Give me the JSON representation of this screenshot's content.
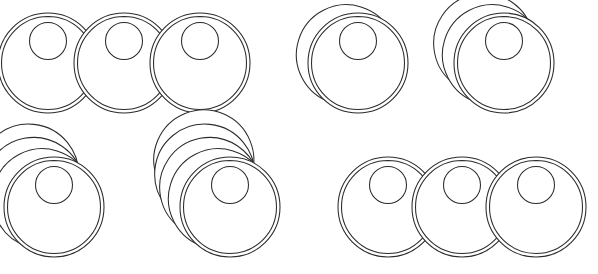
{
  "figure": {
    "canvas": {
      "width": 598,
      "height": 274
    },
    "background_color": "#ffffff",
    "stroke_color": "#2b2b2b",
    "fill_color": "#ffffff",
    "stroke_width": 1.05,
    "shape": {
      "name": "capsule-with-top-circle",
      "body_width": 52,
      "body_height": 100,
      "corner_radius": 26,
      "inner_contour_inset": 3.5,
      "circle_diameter": 37,
      "circle_center_offset_y": 28
    },
    "rotation": {
      "pivot_description": "top-right of capsule body",
      "pivot_x_fraction": 0.92,
      "pivot_y_fraction": 0.07,
      "step_degrees": 17,
      "direction": "clockwise"
    },
    "groups": [
      {
        "id": "group-a",
        "row": 1,
        "column": 1,
        "kind": "separate",
        "label": "three separate capsules",
        "count": 3,
        "copies": 1,
        "origin_x": 22,
        "origin_y": 13,
        "spacing_x": 76
      },
      {
        "id": "group-b",
        "row": 1,
        "column": 2,
        "kind": "fan",
        "label": "fan of two capsules",
        "count": 1,
        "copies": 2,
        "origin_x": 332,
        "origin_y": 13,
        "spacing_x": 0
      },
      {
        "id": "group-c",
        "row": 1,
        "column": 3,
        "kind": "fan",
        "label": "fan of three capsules",
        "count": 1,
        "copies": 3,
        "origin_x": 478,
        "origin_y": 13,
        "spacing_x": 0
      },
      {
        "id": "group-d",
        "row": 2,
        "column": 1,
        "kind": "fan",
        "label": "fan of four capsules",
        "count": 1,
        "copies": 4,
        "origin_x": 28,
        "origin_y": 157,
        "spacing_x": 0
      },
      {
        "id": "group-e",
        "row": 2,
        "column": 2,
        "kind": "fan",
        "label": "fan of five capsules",
        "count": 1,
        "copies": 5,
        "origin_x": 204,
        "origin_y": 157,
        "spacing_x": 0
      },
      {
        "id": "group-f",
        "row": 2,
        "column": 3,
        "kind": "separate",
        "label": "three separate capsules",
        "count": 3,
        "copies": 1,
        "origin_x": 362,
        "origin_y": 157,
        "spacing_x": 74
      }
    ]
  }
}
